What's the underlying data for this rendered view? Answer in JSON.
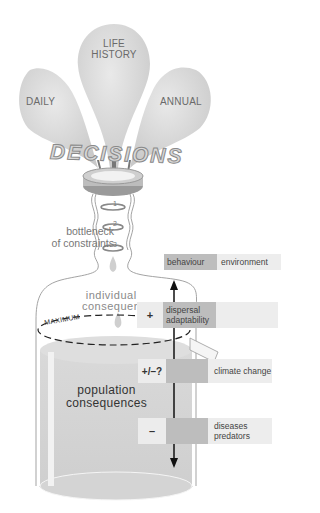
{
  "balloons": {
    "left": {
      "label": "DAILY"
    },
    "center": {
      "label_line1": "LIFE",
      "label_line2": "HISTORY"
    },
    "right": {
      "label": "ANNUAL"
    }
  },
  "decisions": {
    "label": "DECISIONS"
  },
  "bottleneck": {
    "label_line1": "bottleneck",
    "label_line2": "of constraints",
    "rings": [
      "1",
      "2",
      "3"
    ]
  },
  "header_row": {
    "behaviour": "behaviour",
    "environment": "environment"
  },
  "individual": {
    "line1": "individual",
    "line2": "consequen"
  },
  "maximum": {
    "label": "MAXIMUM"
  },
  "factors": [
    {
      "sign": "+",
      "line1": "dispersal",
      "line2": "adaptability"
    },
    {
      "sign": "+/–?",
      "line1": "climate change",
      "line2": ""
    },
    {
      "sign": "–",
      "line1": "diseases",
      "line2": "predators"
    }
  ],
  "population": {
    "line1": "population",
    "line2": "consequences"
  },
  "colors": {
    "balloon": "#d9d9d9",
    "liquid": "#d6d6d6",
    "bar_dark": "#bdbdbd",
    "bar_light": "#ededed"
  }
}
